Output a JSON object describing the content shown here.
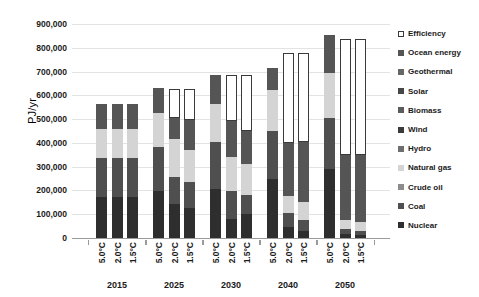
{
  "chart_data": {
    "type": "bar",
    "stacked": true,
    "title": "",
    "xlabel": "",
    "ylabel": "PJ/yr",
    "ylim": [
      0,
      900000
    ],
    "ytick_step": 100000,
    "ytick_labels": [
      "900,000",
      "800,000",
      "700,000",
      "600,000",
      "500,000",
      "400,000",
      "300,000",
      "200,000",
      "100,000",
      "0"
    ],
    "ytick_values": [
      900000,
      800000,
      700000,
      600000,
      500000,
      400000,
      300000,
      200000,
      100000,
      0
    ],
    "grid": true,
    "legend_position": "right",
    "years": [
      "2015",
      "2025",
      "2030",
      "2040",
      "2050"
    ],
    "scenarios": [
      "5.0°C",
      "2.0°C",
      "1.5°C"
    ],
    "series": [
      {
        "name": "Nuclear",
        "color": "#2e2e2e"
      },
      {
        "name": "Coal",
        "color": "#4f4f4f"
      },
      {
        "name": "Crude oil",
        "color": "#8c8c8c"
      },
      {
        "name": "Natural gas",
        "color": "#d4d4d4"
      },
      {
        "name": "Hydro",
        "color": "#6e6e6e"
      },
      {
        "name": "Wind",
        "color": "#3b3b3b"
      },
      {
        "name": "Biomass",
        "color": "#5c5c5c"
      },
      {
        "name": "Solar",
        "color": "#474747"
      },
      {
        "name": "Geothermal",
        "color": "#666666"
      },
      {
        "name": "Ocean energy",
        "color": "#555555"
      },
      {
        "name": "Efficiency",
        "color": "#ffffff"
      }
    ],
    "legend_order": [
      "Efficiency",
      "Ocean energy",
      "Geothermal",
      "Solar",
      "Biomass",
      "Wind",
      "Hydro",
      "Natural gas",
      "Crude oil",
      "Coal",
      "Nuclear"
    ],
    "bars": [
      {
        "year": "2015",
        "scenario": "5.0°C",
        "total": 563000,
        "values": {
          "Nuclear": 172000,
          "Coal": 165000,
          "Crude oil": 0,
          "Natural gas": 120000,
          "Hydro": 0,
          "Wind": 0,
          "Biomass": 0,
          "Solar": 0,
          "Geothermal": 0,
          "Ocean energy": 106000,
          "Efficiency": 0
        }
      },
      {
        "year": "2015",
        "scenario": "2.0°C",
        "total": 563000,
        "values": {
          "Nuclear": 172000,
          "Coal": 165000,
          "Crude oil": 0,
          "Natural gas": 120000,
          "Hydro": 0,
          "Wind": 0,
          "Biomass": 0,
          "Solar": 0,
          "Geothermal": 0,
          "Ocean energy": 106000,
          "Efficiency": 0
        }
      },
      {
        "year": "2015",
        "scenario": "1.5°C",
        "total": 563000,
        "values": {
          "Nuclear": 172000,
          "Coal": 165000,
          "Crude oil": 0,
          "Natural gas": 120000,
          "Hydro": 0,
          "Wind": 0,
          "Biomass": 0,
          "Solar": 0,
          "Geothermal": 0,
          "Ocean energy": 106000,
          "Efficiency": 0
        }
      },
      {
        "year": "2025",
        "scenario": "5.0°C",
        "total": 632000,
        "values": {
          "Nuclear": 196000,
          "Coal": 185000,
          "Crude oil": 0,
          "Natural gas": 145000,
          "Hydro": 0,
          "Wind": 0,
          "Biomass": 0,
          "Solar": 0,
          "Geothermal": 0,
          "Ocean energy": 106000,
          "Efficiency": 0
        }
      },
      {
        "year": "2025",
        "scenario": "2.0°C",
        "total": 628000,
        "values": {
          "Nuclear": 145000,
          "Coal": 110000,
          "Crude oil": 0,
          "Natural gas": 162000,
          "Hydro": 0,
          "Wind": 0,
          "Biomass": 0,
          "Solar": 0,
          "Geothermal": 0,
          "Ocean energy": 88000,
          "Efficiency": 123000
        }
      },
      {
        "year": "2025",
        "scenario": "1.5°C",
        "total": 628000,
        "values": {
          "Nuclear": 125000,
          "Coal": 110000,
          "Crude oil": 0,
          "Natural gas": 135000,
          "Hydro": 0,
          "Wind": 0,
          "Biomass": 0,
          "Solar": 0,
          "Geothermal": 0,
          "Ocean energy": 125000,
          "Efficiency": 133000
        }
      },
      {
        "year": "2030",
        "scenario": "5.0°C",
        "total": 686000,
        "values": {
          "Nuclear": 208000,
          "Coal": 196000,
          "Crude oil": 0,
          "Natural gas": 160000,
          "Hydro": 0,
          "Wind": 0,
          "Biomass": 0,
          "Solar": 0,
          "Geothermal": 0,
          "Ocean energy": 122000,
          "Efficiency": 0
        }
      },
      {
        "year": "2030",
        "scenario": "2.0°C",
        "total": 684000,
        "values": {
          "Nuclear": 78000,
          "Coal": 120000,
          "Crude oil": 0,
          "Natural gas": 144000,
          "Hydro": 0,
          "Wind": 0,
          "Biomass": 0,
          "Solar": 0,
          "Geothermal": 0,
          "Ocean energy": 150000,
          "Efficiency": 192000
        }
      },
      {
        "year": "2030",
        "scenario": "1.5°C",
        "total": 684000,
        "values": {
          "Nuclear": 100000,
          "Coal": 80000,
          "Crude oil": 0,
          "Natural gas": 130000,
          "Hydro": 0,
          "Wind": 0,
          "Biomass": 0,
          "Solar": 0,
          "Geothermal": 0,
          "Ocean energy": 140000,
          "Efficiency": 234000
        }
      },
      {
        "year": "2040",
        "scenario": "5.0°C",
        "total": 784000,
        "values": {
          "Nuclear": 250000,
          "Coal": 200000,
          "Crude oil": 0,
          "Natural gas": 172000,
          "Hydro": 0,
          "Wind": 0,
          "Biomass": 0,
          "Solar": 0,
          "Geothermal": 0,
          "Ocean energy": 94000,
          "Efficiency": 0
        }
      },
      {
        "year": "2040",
        "scenario": "2.0°C",
        "total": 780000,
        "values": {
          "Nuclear": 45000,
          "Coal": 60000,
          "Crude oil": 0,
          "Natural gas": 72000,
          "Hydro": 0,
          "Wind": 0,
          "Biomass": 0,
          "Solar": 0,
          "Geothermal": 0,
          "Ocean energy": 223000,
          "Efficiency": 380000
        }
      },
      {
        "year": "2040",
        "scenario": "1.5°C",
        "total": 780000,
        "values": {
          "Nuclear": 30000,
          "Coal": 45000,
          "Crude oil": 0,
          "Natural gas": 75000,
          "Hydro": 0,
          "Wind": 0,
          "Biomass": 0,
          "Solar": 0,
          "Geothermal": 0,
          "Ocean energy": 255000,
          "Efficiency": 375000
        }
      },
      {
        "year": "2050",
        "scenario": "5.0°C",
        "total": 852000,
        "values": {
          "Nuclear": 290000,
          "Coal": 215000,
          "Crude oil": 0,
          "Natural gas": 190000,
          "Hydro": 0,
          "Wind": 0,
          "Biomass": 0,
          "Solar": 0,
          "Geothermal": 0,
          "Ocean energy": 157000,
          "Efficiency": 0
        }
      },
      {
        "year": "2050",
        "scenario": "2.0°C",
        "total": 838000,
        "values": {
          "Nuclear": 18000,
          "Coal": 20000,
          "Crude oil": 0,
          "Natural gas": 38000,
          "Hydro": 0,
          "Wind": 0,
          "Biomass": 0,
          "Solar": 0,
          "Geothermal": 0,
          "Ocean energy": 274000,
          "Efficiency": 488000
        }
      },
      {
        "year": "2050",
        "scenario": "1.5°C",
        "total": 838000,
        "values": {
          "Nuclear": 12000,
          "Coal": 16000,
          "Crude oil": 0,
          "Natural gas": 40000,
          "Hydro": 0,
          "Wind": 0,
          "Biomass": 0,
          "Solar": 0,
          "Geothermal": 0,
          "Ocean energy": 280000,
          "Efficiency": 490000
        }
      }
    ]
  }
}
